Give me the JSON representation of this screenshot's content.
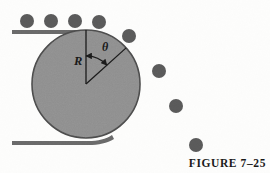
{
  "figure": {
    "caption": "FIGURE 7–25",
    "labels": {
      "radius": "R",
      "angle": "θ"
    },
    "colors": {
      "disk_fill": "#8f8f8f",
      "disk_stroke": "#4a4a4a",
      "ball_fill": "#5a5a5a",
      "track_fill": "#6a6a6a",
      "line_stroke": "#1a1a1a",
      "background": "#fdfdfc",
      "text": "#1a1a1a"
    },
    "disk": {
      "center_x": 86,
      "center_y": 84,
      "radius": 54
    },
    "angle_degrees": 48,
    "top_track": {
      "x_start": 12,
      "x_end": 92,
      "y": 30,
      "thickness": 4
    },
    "bottom_track": {
      "x_start": 12,
      "x_end": 100,
      "y": 143,
      "thickness": 4
    },
    "balls_on_track": [
      {
        "cx": 27,
        "cy": 21,
        "r": 7
      },
      {
        "cx": 51,
        "cy": 21,
        "r": 7
      },
      {
        "cx": 75,
        "cy": 21,
        "r": 7
      },
      {
        "cx": 99,
        "cy": 22,
        "r": 7
      },
      {
        "cx": 129,
        "cy": 36,
        "r": 7
      }
    ],
    "balls_falling": [
      {
        "cx": 159,
        "cy": 71,
        "r": 7
      },
      {
        "cx": 176,
        "cy": 106,
        "r": 7
      },
      {
        "cx": 196,
        "cy": 145,
        "r": 7
      }
    ],
    "label_positions": {
      "radius_x": 74,
      "radius_y": 55,
      "angle_x": 102,
      "angle_y": 41
    }
  }
}
